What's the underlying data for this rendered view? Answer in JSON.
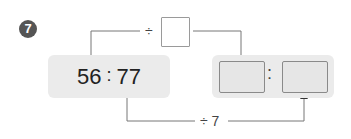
{
  "problem": {
    "number": "7",
    "left_ratio": {
      "first": "56",
      "separator": ":",
      "second": "77"
    },
    "top_operation": {
      "operator": "÷",
      "operand": ""
    },
    "bottom_operation": {
      "label": "÷ 7"
    },
    "right_ratio": {
      "first": "",
      "separator": ":",
      "second": ""
    }
  }
}
